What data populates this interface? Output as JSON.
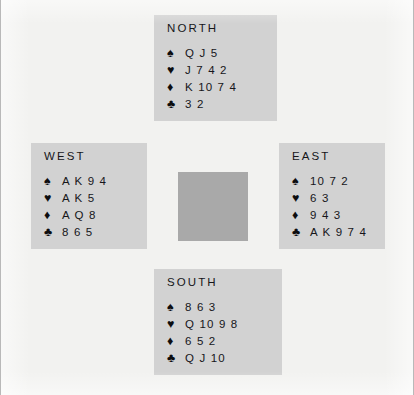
{
  "diagram": {
    "name": "bridge-deal-diagram",
    "background_color": "#f2f2f0",
    "panel_color": "#d2d2d2",
    "center_color": "#a9a9a9",
    "suits": {
      "spade": "♠",
      "heart": "♥",
      "diamond": "♦",
      "club": "♣"
    },
    "hands": {
      "north": {
        "label": "NORTH",
        "spades": "Q J 5",
        "hearts": "J 7 4 2",
        "diamonds": "K 10 7 4",
        "clubs": "3 2"
      },
      "west": {
        "label": "WEST",
        "spades": "A K 9 4",
        "hearts": "A K 5",
        "diamonds": "A Q 8",
        "clubs": "8 6 5"
      },
      "east": {
        "label": "EAST",
        "spades": "10 7 2",
        "hearts": "6 3",
        "diamonds": "9 4 3",
        "clubs": "A K 9 7 4"
      },
      "south": {
        "label": "SOUTH",
        "spades": "8 6 3",
        "hearts": "Q 10 9 8",
        "diamonds": "6 5 2",
        "clubs": "Q J 10"
      }
    }
  }
}
